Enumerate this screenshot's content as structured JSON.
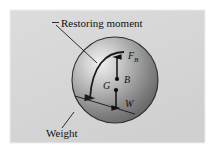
{
  "figure": {
    "canvas": {
      "width": 214,
      "height": 152,
      "background": "#ffffff"
    },
    "panel": {
      "x": 10,
      "y": 10,
      "width": 195,
      "height": 133,
      "fill": "#d9d9d9",
      "border_color": "#f2f2f2"
    },
    "sphere": {
      "center_x": 115,
      "center_y": 80,
      "radius": 43,
      "highlight_color": "#efefef",
      "mid_color": "#9e9e9e",
      "shadow_color": "#5a5a5a",
      "outline_color": "#2b2b2b"
    }
  },
  "callouts": [
    {
      "id": "restoring-moment",
      "label": "Restoring moment",
      "text_x": 61,
      "text_y": 27,
      "dash_x1": 52,
      "dash_y1": 23,
      "dash_x2": 59,
      "dash_y2": 23,
      "leader_x1": 57,
      "leader_y1": 26,
      "leader_x2": 97,
      "leader_y2": 63
    },
    {
      "id": "weight",
      "label": "Weight",
      "text_x": 46,
      "text_y": 136,
      "leader_x1": 62,
      "leader_y1": 128,
      "leader_x2": 73,
      "leader_y2": 113
    }
  ],
  "vectors": [
    {
      "id": "buoyancy-force",
      "symbol": "F",
      "subscript": "B",
      "label_x": 128,
      "label_y": 58,
      "sub_x": 134,
      "sub_y": 61,
      "tail_x": 117,
      "tail_y": 78,
      "head_x": 117,
      "head_y": 57,
      "direction": "up"
    },
    {
      "id": "weight-force",
      "symbol": "W",
      "subscript": "",
      "label_x": 126,
      "label_y": 106,
      "sub_x": 0,
      "sub_y": 0,
      "tail_x": 116,
      "tail_y": 90,
      "head_x": 116,
      "head_y": 108,
      "direction": "down"
    }
  ],
  "points": [
    {
      "id": "center-of-buoyancy",
      "label": "B",
      "dot_x": 117,
      "dot_y": 79,
      "label_x": 124,
      "label_y": 82
    },
    {
      "id": "center-of-gravity",
      "label": "G",
      "dot_x": 116,
      "dot_y": 90,
      "label_x": 104,
      "label_y": 89
    }
  ],
  "moment_arc": {
    "id": "restoring-moment-arc",
    "path": "M 124 52 C 106 52 92 66 90 92",
    "arrowhead_x": 90,
    "arrowhead_y": 100,
    "direction": "counterclockwise"
  },
  "chord": {
    "id": "waterline-chord",
    "x1": 75,
    "y1": 96,
    "x2": 135,
    "y2": 114
  }
}
